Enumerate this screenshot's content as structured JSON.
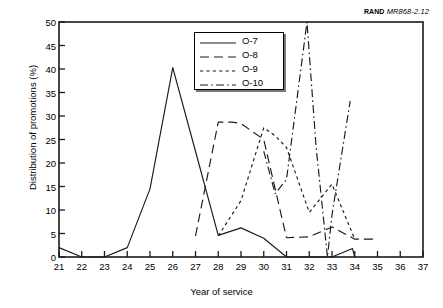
{
  "figure": {
    "source_note_prefix": "RAND",
    "source_note_id": "MR868-2.12"
  },
  "legend": {
    "position": "inside-top-center",
    "entries": [
      {
        "label": "O-7",
        "dash": "none"
      },
      {
        "label": "O-8",
        "dash": "dashed"
      },
      {
        "label": "O-9",
        "dash": "dotted"
      },
      {
        "label": "O-10",
        "dash": "dash-dot"
      }
    ]
  },
  "chart_data": {
    "type": "line",
    "title": "",
    "xlabel": "Year of service",
    "ylabel": "Distribution of promotions (%)",
    "xlim": [
      21,
      37
    ],
    "ylim": [
      0,
      50
    ],
    "xticks": [
      21,
      22,
      23,
      24,
      25,
      26,
      27,
      28,
      29,
      30,
      31,
      32,
      33,
      34,
      35,
      36,
      37
    ],
    "yticks": [
      0,
      5,
      10,
      15,
      20,
      25,
      30,
      35,
      40,
      45,
      50
    ],
    "grid": false,
    "line_color": "#1a1a1a",
    "series": [
      {
        "name": "O-7",
        "dash": "none",
        "x": [
          21,
          22,
          23,
          24,
          25,
          26,
          27,
          28,
          29,
          30,
          31,
          32,
          33,
          33.9,
          34
        ],
        "y": [
          2.0,
          0.0,
          0.0,
          2.0,
          14.5,
          40.3,
          22.5,
          4.6,
          6.2,
          4.0,
          0.0,
          0.0,
          0.0,
          1.8,
          0.0
        ]
      },
      {
        "name": "O-8",
        "dash": "dashed",
        "x": [
          27,
          28,
          28.6,
          29,
          30,
          31,
          32,
          33,
          34,
          35
        ],
        "y": [
          4.5,
          28.7,
          28.7,
          28.4,
          25.0,
          4.1,
          4.3,
          6.4,
          3.8,
          3.8
        ]
      },
      {
        "name": "O-9",
        "dash": "dotted",
        "x": [
          28,
          29,
          30,
          30.5,
          31,
          32,
          33,
          34
        ],
        "y": [
          4.5,
          12.0,
          27.5,
          25.8,
          23.3,
          9.5,
          15.5,
          3.8
        ]
      },
      {
        "name": "O-10",
        "dash": "dash-dot",
        "x": [
          30,
          30.5,
          31,
          31.9,
          32.3,
          32.8,
          33,
          33.8
        ],
        "y": [
          22.5,
          13.5,
          16.5,
          50.0,
          23.5,
          0.0,
          9.0,
          33.2
        ]
      }
    ]
  }
}
